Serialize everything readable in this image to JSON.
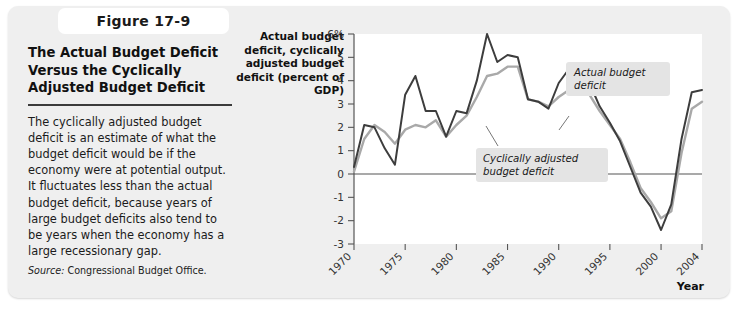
{
  "figure": {
    "tab_label": "Figure 17-9",
    "title": "The Actual Budget Deficit Versus the Cyclically Adjusted Budget Deficit",
    "body": "The cyclically adjusted budget deficit is an estimate of what the budget deficit would be if the economy were at potential output. It fluctuates less than the actual budget deficit, because years of large budget deficits also tend to be years when the economy has a large recessionary gap.",
    "source_label": "Source:",
    "source_text": "Congressional Budget Office."
  },
  "chart_data": {
    "type": "line",
    "title": "",
    "xlabel": "Year",
    "ylabel": "Actual budget deficit, cyclically adjusted budget deficit (percent of GDP)",
    "xlim": [
      1970,
      2004
    ],
    "ylim": [
      -3,
      6
    ],
    "grid": false,
    "legend_position": "inline-annotations",
    "y_ticks": [
      6,
      5,
      4,
      3,
      2,
      1,
      0,
      -1,
      -2,
      -3
    ],
    "y_tick_labels": [
      "6%",
      "5",
      "4",
      "3",
      "2",
      "1",
      "0",
      "-1",
      "-2",
      "-3"
    ],
    "x_ticks": [
      1970,
      1975,
      1980,
      1985,
      1990,
      1995,
      2000,
      2004
    ],
    "x_tick_labels": [
      "1970",
      "1975",
      "1980",
      "1985",
      "1990",
      "1995",
      "2000",
      "2004"
    ],
    "zero_line": 0,
    "x": [
      1970,
      1971,
      1972,
      1973,
      1974,
      1975,
      1976,
      1977,
      1978,
      1979,
      1980,
      1981,
      1982,
      1983,
      1984,
      1985,
      1986,
      1987,
      1988,
      1989,
      1990,
      1991,
      1992,
      1993,
      1994,
      1995,
      1996,
      1997,
      1998,
      1999,
      2000,
      2001,
      2002,
      2003,
      2004
    ],
    "series": [
      {
        "name": "Actual budget deficit",
        "color": "#3d3d3d",
        "values": [
          0.3,
          2.1,
          2.0,
          1.1,
          0.4,
          3.4,
          4.2,
          2.7,
          2.7,
          1.6,
          2.7,
          2.6,
          4.0,
          6.0,
          4.8,
          5.1,
          5.0,
          3.2,
          3.1,
          2.8,
          3.9,
          4.5,
          4.7,
          3.9,
          2.9,
          2.2,
          1.4,
          0.3,
          -0.8,
          -1.4,
          -2.4,
          -1.3,
          1.5,
          3.5,
          3.6
        ]
      },
      {
        "name": "Cyclically adjusted budget deficit",
        "color": "#a9a9a9",
        "values": [
          0.1,
          1.5,
          2.1,
          1.8,
          1.3,
          1.9,
          2.1,
          2.0,
          2.3,
          1.6,
          2.1,
          2.5,
          3.3,
          4.2,
          4.3,
          4.6,
          4.6,
          3.2,
          3.1,
          2.9,
          3.3,
          3.6,
          3.8,
          3.4,
          2.7,
          2.1,
          1.5,
          0.5,
          -0.6,
          -1.2,
          -1.9,
          -1.6,
          0.9,
          2.8,
          3.1
        ]
      }
    ],
    "annotations": [
      {
        "text_line1": "Actual budget",
        "text_line2": "deficit"
      },
      {
        "text_line1": "Cyclically adjusted",
        "text_line2": "budget deficit"
      }
    ]
  }
}
